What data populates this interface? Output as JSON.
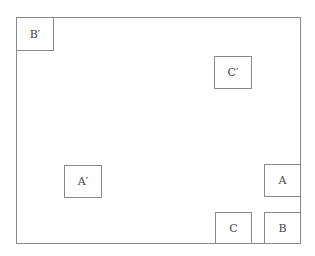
{
  "diagram": {
    "frame": {
      "x": 16,
      "y": 17,
      "width": 285,
      "height": 227,
      "border_color": "#8a8a8a"
    },
    "boxes": [
      {
        "id": "b-prime",
        "label": "B′",
        "x": 16,
        "y": 17,
        "width": 38,
        "height": 34
      },
      {
        "id": "c-prime",
        "label": "C′",
        "x": 214,
        "y": 56,
        "width": 38,
        "height": 33
      },
      {
        "id": "a-prime",
        "label": "A′",
        "x": 64,
        "y": 165,
        "width": 38,
        "height": 33
      },
      {
        "id": "a",
        "label": "A",
        "x": 264,
        "y": 164,
        "width": 37,
        "height": 33
      },
      {
        "id": "c",
        "label": "C",
        "x": 215,
        "y": 212,
        "width": 37,
        "height": 32
      },
      {
        "id": "b",
        "label": "B",
        "x": 264,
        "y": 212,
        "width": 37,
        "height": 32
      }
    ]
  }
}
